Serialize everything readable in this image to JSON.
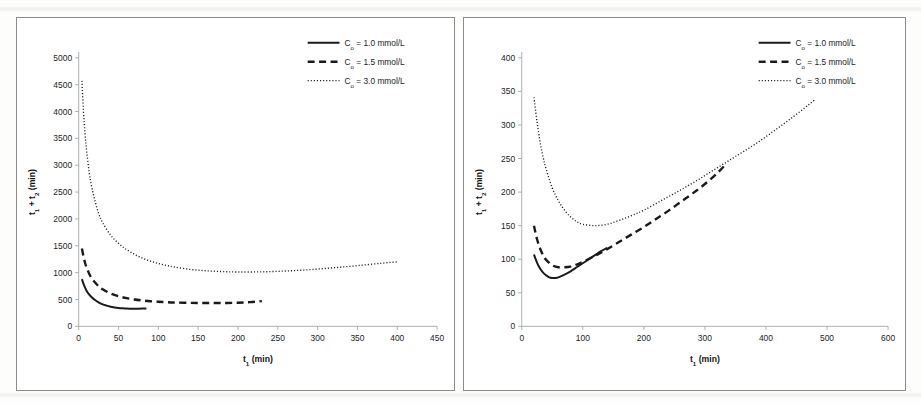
{
  "document": {
    "kind": "scanned-figure-pair",
    "background_color": "#ffffff",
    "ink_color": "#1a1a1a",
    "axis_color": "#a6a6a6",
    "panel_border_color": "#8c8c8c"
  },
  "panels": [
    {
      "name": "left-panel",
      "chart_index": 0
    },
    {
      "name": "right-panel",
      "chart_index": 1
    }
  ],
  "chart_data": [
    {
      "type": "line",
      "title": "",
      "xlabel": "t₁ (min)",
      "ylabel": "t₁ + t₂ (min)",
      "xlim": [
        0,
        450
      ],
      "ylim": [
        0,
        5000
      ],
      "xticks": [
        0,
        50,
        100,
        150,
        200,
        250,
        300,
        350,
        400,
        450
      ],
      "xtick_labels": [
        "0",
        "50",
        "100",
        "150",
        "200",
        "250",
        "300",
        "350",
        "400",
        "450"
      ],
      "yticks": [
        0,
        500,
        1000,
        1500,
        2000,
        2500,
        3000,
        3500,
        4000,
        4500,
        5000
      ],
      "ytick_labels": [
        "0",
        "500",
        "1000",
        "1500",
        "2000",
        "2500",
        "3000",
        "3500",
        "4000",
        "4500",
        "5000"
      ],
      "grid": false,
      "legend_position": "top-right",
      "series": [
        {
          "name": "Co = 1.0 mmol/L",
          "style": "solid",
          "x": [
            4,
            6,
            8,
            10,
            13,
            16,
            20,
            25,
            30,
            35,
            40,
            45,
            50,
            55,
            60,
            65,
            70,
            75,
            80,
            85
          ],
          "y": [
            880,
            790,
            720,
            660,
            595,
            545,
            495,
            445,
            410,
            385,
            365,
            352,
            342,
            335,
            330,
            328,
            327,
            328,
            330,
            333
          ]
        },
        {
          "name": "Co = 1.5 mmol/L",
          "style": "dashed",
          "x": [
            4,
            6,
            8,
            10,
            13,
            16,
            20,
            25,
            30,
            40,
            50,
            60,
            70,
            80,
            90,
            100,
            110,
            120,
            140,
            160,
            180,
            200,
            215,
            230
          ],
          "y": [
            1450,
            1300,
            1180,
            1090,
            985,
            905,
            825,
            745,
            690,
            610,
            560,
            525,
            500,
            482,
            468,
            458,
            450,
            444,
            437,
            434,
            434,
            440,
            450,
            470
          ]
        },
        {
          "name": "Co = 3.0 mmol/L",
          "style": "dotted",
          "x": [
            4,
            6,
            8,
            10,
            13,
            16,
            20,
            25,
            30,
            40,
            50,
            60,
            70,
            80,
            90,
            100,
            110,
            120,
            140,
            160,
            180,
            200,
            230,
            260,
            290,
            320,
            350,
            380,
            400
          ],
          "y": [
            4570,
            4000,
            3580,
            3260,
            2890,
            2620,
            2360,
            2100,
            1930,
            1700,
            1545,
            1430,
            1340,
            1270,
            1215,
            1170,
            1135,
            1105,
            1060,
            1035,
            1020,
            1012,
            1015,
            1030,
            1055,
            1090,
            1130,
            1175,
            1200
          ]
        }
      ]
    },
    {
      "type": "line",
      "title": "",
      "xlabel": "t₁ (min)",
      "ylabel": "t₁ + t₂ (min)",
      "xlim": [
        0,
        600
      ],
      "ylim": [
        0,
        400
      ],
      "xticks": [
        0,
        100,
        200,
        300,
        400,
        500,
        600
      ],
      "xtick_labels": [
        "0",
        "100",
        "200",
        "300",
        "400",
        "500",
        "600"
      ],
      "yticks": [
        0,
        50,
        100,
        150,
        200,
        250,
        300,
        350,
        400
      ],
      "ytick_labels": [
        "0",
        "50",
        "100",
        "150",
        "200",
        "250",
        "300",
        "350",
        "400"
      ],
      "grid": false,
      "legend_position": "top-right",
      "series": [
        {
          "name": "Co = 1.0 mmol/L",
          "style": "solid",
          "x": [
            20,
            25,
            30,
            35,
            40,
            45,
            50,
            55,
            60,
            70,
            80,
            90,
            100,
            110,
            120,
            130,
            140
          ],
          "y": [
            107,
            95,
            86,
            80,
            76,
            73,
            72,
            72,
            73,
            77,
            82,
            88,
            94,
            100,
            106,
            112,
            117
          ]
        },
        {
          "name": "Co = 1.5 mmol/L",
          "style": "dashed",
          "x": [
            20,
            25,
            30,
            35,
            40,
            50,
            60,
            70,
            80,
            90,
            100,
            120,
            140,
            160,
            180,
            200,
            220,
            240,
            260,
            280,
            300,
            320,
            335
          ],
          "y": [
            150,
            130,
            116,
            106,
            99,
            91,
            88,
            88,
            89,
            92,
            96,
            105,
            115,
            126,
            137,
            148,
            160,
            172,
            185,
            198,
            212,
            228,
            242
          ]
        },
        {
          "name": "Co = 3.0 mmol/L",
          "style": "dotted",
          "x": [
            20,
            25,
            30,
            35,
            40,
            50,
            60,
            70,
            80,
            90,
            100,
            120,
            140,
            160,
            180,
            200,
            230,
            260,
            290,
            320,
            350,
            380,
            410,
            440,
            470,
            480
          ],
          "y": [
            341,
            305,
            275,
            252,
            234,
            206,
            187,
            173,
            163,
            156,
            152,
            150,
            152,
            158,
            165,
            173,
            188,
            203,
            219,
            236,
            253,
            270,
            289,
            309,
            330,
            338
          ]
        }
      ],
      "annotations": []
    }
  ]
}
